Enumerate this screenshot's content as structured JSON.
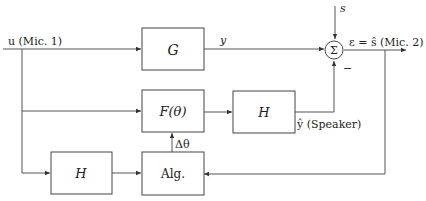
{
  "diagram": {
    "blocks": {
      "G": {
        "label": "G"
      },
      "F": {
        "label": "F(θ)"
      },
      "H_upper": {
        "label": "H"
      },
      "H_lower": {
        "label": "H"
      },
      "Alg": {
        "label": "Alg."
      }
    },
    "summer": {
      "label": "Σ",
      "minus_sign": "−"
    },
    "signals": {
      "input": "u (Mic. 1)",
      "y": "y",
      "s": "s",
      "output": "ε = ŝ (Mic. 2)",
      "speaker": "ŷ (Speaker)",
      "delta_theta": "Δθ"
    },
    "colors": {
      "line": "#555555",
      "box_stroke": "#444444",
      "text": "#222222"
    }
  }
}
